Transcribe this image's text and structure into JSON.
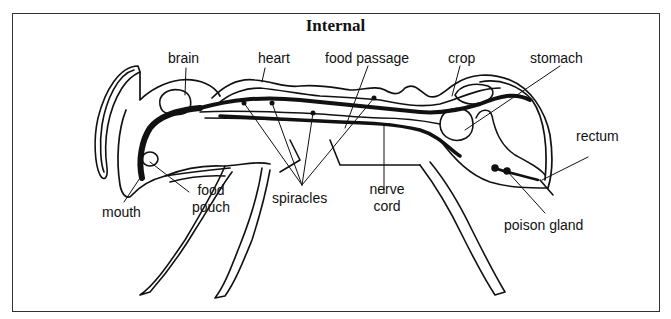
{
  "figure": {
    "title": "Internal",
    "labels": {
      "brain": "brain",
      "heart": "heart",
      "food_passage": "food passage",
      "crop": "crop",
      "stomach": "stomach",
      "rectum": "rectum",
      "mouth": "mouth",
      "food_pouch_1": "food",
      "food_pouch_2": "pouch",
      "spiracles": "spiracles",
      "nerve_cord_1": "nerve",
      "nerve_cord_2": "cord",
      "poison_gland": "poison gland"
    },
    "colors": {
      "ink": "#111111",
      "border": "#333333",
      "background": "#ffffff"
    }
  }
}
